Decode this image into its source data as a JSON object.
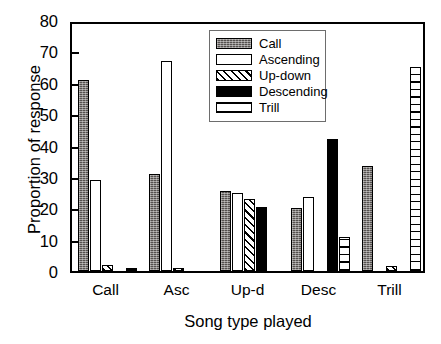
{
  "chart_data": {
    "type": "bar",
    "title": "",
    "xlabel": "Song type played",
    "ylabel": "Proportion of response",
    "categories": [
      "Call",
      "Asc",
      "Up-d",
      "Desc",
      "Trill"
    ],
    "ylim": [
      0,
      80
    ],
    "yticks": [
      0,
      10,
      20,
      30,
      40,
      50,
      60,
      70,
      80
    ],
    "ytick_labels": [
      "0",
      "10",
      "20",
      "30",
      "40",
      "50",
      "60",
      "70",
      "80"
    ],
    "grid": false,
    "legend_position": "top-center",
    "series": [
      {
        "name": "Call",
        "fill": "dark-stipple",
        "values": [
          61,
          31,
          25.5,
          20,
          33.5
        ]
      },
      {
        "name": "Ascending",
        "fill": "white",
        "values": [
          29,
          67,
          25,
          23.5,
          0
        ]
      },
      {
        "name": "Up-down",
        "fill": "diagonal-hatch",
        "values": [
          2,
          1,
          23,
          0,
          1.5
        ]
      },
      {
        "name": "Descending",
        "fill": "solid-black",
        "values": [
          0,
          0,
          20.5,
          42,
          0
        ]
      },
      {
        "name": "Trill",
        "fill": "horizontal-lines",
        "values": [
          1,
          0,
          0,
          11,
          65
        ]
      }
    ]
  },
  "legend": {
    "items": [
      {
        "label": "Call"
      },
      {
        "label": "Ascending"
      },
      {
        "label": "Up-down"
      },
      {
        "label": "Descending"
      },
      {
        "label": "Trill"
      }
    ]
  }
}
